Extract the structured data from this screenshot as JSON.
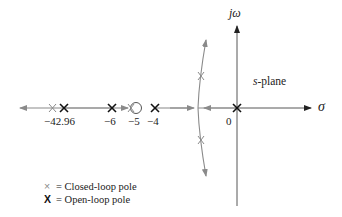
{
  "diagram": {
    "type": "root-locus",
    "axes": {
      "real_axis_label": "σ",
      "imag_axis_label": "jω",
      "plane_label_italic": "s",
      "plane_label_rest": "-plane"
    },
    "tick_labels": [
      {
        "id": "t1",
        "text": "−42.96"
      },
      {
        "id": "t2",
        "text": "−6"
      },
      {
        "id": "t3",
        "text": "−5"
      },
      {
        "id": "t4",
        "text": "−4"
      },
      {
        "id": "t5",
        "text": "0"
      }
    ],
    "open_loop_poles": [
      -42.96,
      -6,
      -4,
      0
    ],
    "zeros": [
      -5
    ],
    "closed_loop_poles_description": "one real pole left of −42.96, one real pole between −6 and −5, complex-conjugate pair on the curved branches",
    "legend": {
      "closed_loop_symbol": "×",
      "closed_loop_label": "= Closed-loop pole",
      "open_loop_symbol": "X",
      "open_loop_label": "= Open-loop pole"
    },
    "colors": {
      "locus": "#8a8a8a",
      "axis": "#333333",
      "open_pole": "#111111"
    }
  }
}
